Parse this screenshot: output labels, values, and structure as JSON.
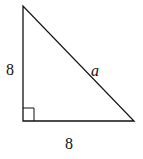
{
  "diagram": {
    "type": "right-triangle",
    "vertices": {
      "top": [
        23,
        6
      ],
      "bottom_left": [
        23,
        121
      ],
      "bottom_right": [
        134,
        121
      ]
    },
    "right_angle_at": "bottom_left",
    "labels": {
      "left_side": "8",
      "bottom_side": "8",
      "hypotenuse": "a"
    },
    "stroke_color": "#111111"
  }
}
